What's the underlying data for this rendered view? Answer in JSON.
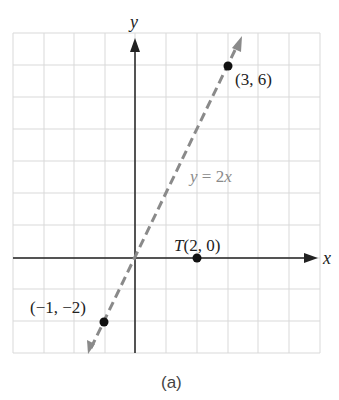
{
  "chart_data": {
    "type": "line",
    "title": "",
    "caption": "(a)",
    "xlabel": "x",
    "ylabel": "y",
    "xlim": [
      -4,
      6
    ],
    "ylim": [
      -3,
      7
    ],
    "grid": true,
    "series": [
      {
        "name": "y = 2x",
        "style": "dashed",
        "color": "#808080",
        "x": [
          -1.4,
          3.5
        ],
        "y": [
          -2.8,
          7
        ]
      }
    ],
    "points": [
      {
        "label": "(3, 6)",
        "x": 3,
        "y": 6
      },
      {
        "label": "T(2, 0)",
        "x": 2,
        "y": 0
      },
      {
        "label": "(−1, −2)",
        "x": -1,
        "y": -2
      }
    ],
    "annotations": [
      {
        "text": "y = 2x",
        "x": 2.3,
        "y": 3.3
      }
    ]
  },
  "labels": {
    "x_axis": "x",
    "y_axis": "y",
    "line_label": "y = 2x",
    "point_a": "(3, 6)",
    "point_t": "T(2, 0)",
    "point_b": "(−1, −2)",
    "caption": "(a)"
  }
}
